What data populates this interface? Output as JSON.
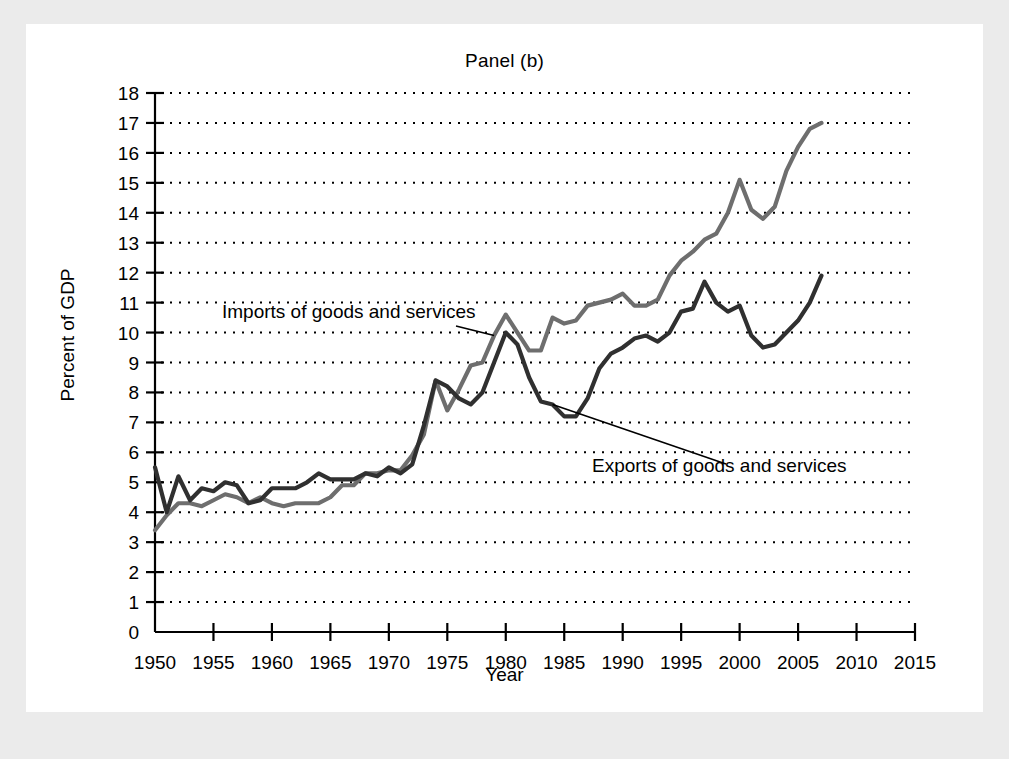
{
  "figure": {
    "title": "Panel (b)",
    "background_color": "#ebebeb",
    "plot_background_color": "#ffffff"
  },
  "chart_data": {
    "type": "line",
    "title": "Panel (b)",
    "xlabel": "Year",
    "ylabel": "Percent of GDP",
    "xlim": [
      1950,
      2015
    ],
    "ylim": [
      0,
      18
    ],
    "xticks": [
      1950,
      1955,
      1960,
      1965,
      1970,
      1975,
      1980,
      1985,
      1990,
      1995,
      2000,
      2005,
      2010,
      2015
    ],
    "yticks": [
      0,
      1,
      2,
      3,
      4,
      5,
      6,
      7,
      8,
      9,
      10,
      11,
      12,
      13,
      14,
      15,
      16,
      17,
      18
    ],
    "grid": "horizontal-dotted",
    "legend_position": "inline-annotations",
    "x": [
      1950,
      1951,
      1952,
      1953,
      1954,
      1955,
      1956,
      1957,
      1958,
      1959,
      1960,
      1961,
      1962,
      1963,
      1964,
      1965,
      1966,
      1967,
      1968,
      1969,
      1970,
      1971,
      1972,
      1973,
      1974,
      1975,
      1976,
      1977,
      1978,
      1979,
      1980,
      1981,
      1982,
      1983,
      1984,
      1985,
      1986,
      1987,
      1988,
      1989,
      1990,
      1991,
      1992,
      1993,
      1994,
      1995,
      1996,
      1997,
      1998,
      1999,
      2000,
      2001,
      2002,
      2003,
      2004,
      2005,
      2006,
      2007
    ],
    "series": [
      {
        "name": "Imports of goods and services",
        "color": "#6e6e6e",
        "values": [
          3.4,
          3.9,
          4.3,
          4.3,
          4.2,
          4.4,
          4.6,
          4.5,
          4.3,
          4.5,
          4.3,
          4.2,
          4.3,
          4.3,
          4.3,
          4.5,
          4.9,
          4.9,
          5.3,
          5.3,
          5.4,
          5.4,
          5.9,
          6.6,
          8.4,
          7.4,
          8.1,
          8.9,
          9.0,
          9.9,
          10.6,
          10.0,
          9.4,
          9.4,
          10.5,
          10.3,
          10.4,
          10.9,
          11.0,
          11.1,
          11.3,
          10.9,
          10.9,
          11.1,
          11.9,
          12.4,
          12.7,
          13.1,
          13.3,
          14.0,
          15.1,
          14.1,
          13.8,
          14.2,
          15.4,
          16.2,
          16.8,
          17.0
        ]
      },
      {
        "name": "Exports of goods and services",
        "color": "#303030",
        "values": [
          5.5,
          4.0,
          5.2,
          4.4,
          4.8,
          4.7,
          5.0,
          4.9,
          4.3,
          4.4,
          4.8,
          4.8,
          4.8,
          5.0,
          5.3,
          5.1,
          5.1,
          5.1,
          5.3,
          5.2,
          5.5,
          5.3,
          5.6,
          6.9,
          8.4,
          8.2,
          7.8,
          7.6,
          8.0,
          9.0,
          10.0,
          9.6,
          8.5,
          7.7,
          7.6,
          7.2,
          7.2,
          7.8,
          8.8,
          9.3,
          9.5,
          9.8,
          9.9,
          9.7,
          10.0,
          10.7,
          10.8,
          11.7,
          11.0,
          10.7,
          10.9,
          9.9,
          9.5,
          9.6,
          10.0,
          10.4,
          11.0,
          11.9
        ]
      }
    ],
    "annotations": [
      {
        "text": "Imports of goods and services",
        "points_to_series": "Imports of goods and services",
        "point_year": 1979,
        "point_value": 9.9
      },
      {
        "text": "Exports of goods and services",
        "points_to_series": "Exports of goods and services",
        "point_year": 1984,
        "point_value": 7.6
      }
    ]
  }
}
